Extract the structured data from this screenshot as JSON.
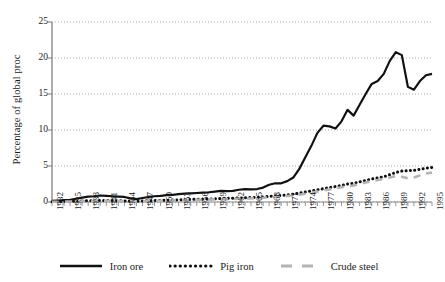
{
  "chart_data": {
    "type": "line",
    "title": "",
    "xlabel": "",
    "ylabel": "Percentage of global proc",
    "ylim": [
      0,
      25
    ],
    "yticks": [
      0,
      5,
      10,
      15,
      20,
      25
    ],
    "xlim": [
      1932,
      1995
    ],
    "xtick_step": 3,
    "grid": true,
    "grid_axis": "y",
    "grid_style": "dotted",
    "legend_position": "bottom-center",
    "x": [
      1932,
      1933,
      1934,
      1935,
      1936,
      1937,
      1938,
      1939,
      1940,
      1941,
      1942,
      1943,
      1944,
      1945,
      1946,
      1947,
      1948,
      1949,
      1950,
      1951,
      1952,
      1953,
      1954,
      1955,
      1956,
      1957,
      1958,
      1959,
      1960,
      1961,
      1962,
      1963,
      1964,
      1965,
      1966,
      1967,
      1968,
      1969,
      1970,
      1971,
      1972,
      1973,
      1974,
      1975,
      1976,
      1977,
      1978,
      1979,
      1980,
      1981,
      1982,
      1983,
      1984,
      1985,
      1986,
      1987,
      1988,
      1989,
      1990,
      1991,
      1992,
      1993,
      1994,
      1995
    ],
    "xticklabels": [
      "1932",
      "1935",
      "1938",
      "1941",
      "1944",
      "1947",
      "1950",
      "1953",
      "1956",
      "1959",
      "1962",
      "1965",
      "1968",
      "1971",
      "1974",
      "1977",
      "1980",
      "1983",
      "1986",
      "1989",
      "1992",
      "1995"
    ],
    "series": [
      {
        "name": "Iron ore",
        "color": "#111111",
        "style": "solid",
        "values": [
          0.15,
          0.2,
          0.25,
          0.3,
          0.45,
          0.6,
          0.75,
          0.8,
          0.9,
          0.85,
          0.8,
          0.75,
          0.7,
          0.5,
          0.4,
          0.55,
          0.7,
          0.8,
          0.85,
          0.95,
          1.0,
          1.1,
          1.15,
          1.2,
          1.25,
          1.3,
          1.35,
          1.45,
          1.55,
          1.5,
          1.55,
          1.7,
          1.8,
          1.75,
          1.8,
          2.0,
          2.4,
          2.6,
          2.6,
          2.9,
          3.4,
          4.6,
          6.2,
          7.8,
          9.6,
          10.6,
          10.5,
          10.2,
          11.2,
          12.8,
          12.0,
          13.5,
          15.0,
          16.4,
          16.8,
          17.8,
          19.6,
          20.8,
          20.4,
          16.0,
          15.6,
          16.8,
          17.6,
          17.8
        ]
      },
      {
        "name": "Pig iron",
        "color": "#111111",
        "style": "dotted",
        "values": [
          0.05,
          0.06,
          0.08,
          0.1,
          0.12,
          0.15,
          0.18,
          0.2,
          0.22,
          0.22,
          0.2,
          0.18,
          0.16,
          0.12,
          0.1,
          0.14,
          0.18,
          0.2,
          0.22,
          0.25,
          0.28,
          0.3,
          0.32,
          0.35,
          0.38,
          0.4,
          0.42,
          0.45,
          0.48,
          0.5,
          0.52,
          0.55,
          0.6,
          0.62,
          0.65,
          0.7,
          0.78,
          0.85,
          0.9,
          1.0,
          1.1,
          1.25,
          1.4,
          1.55,
          1.7,
          1.85,
          2.0,
          2.15,
          2.3,
          2.5,
          2.6,
          2.8,
          3.0,
          3.2,
          3.35,
          3.5,
          3.8,
          4.1,
          4.3,
          4.35,
          4.4,
          4.55,
          4.7,
          4.8
        ]
      },
      {
        "name": "Crude steel",
        "color": "#b3b3b3",
        "style": "dashed",
        "values": [
          0.03,
          0.04,
          0.05,
          0.07,
          0.09,
          0.12,
          0.14,
          0.16,
          0.18,
          0.18,
          0.16,
          0.14,
          0.12,
          0.09,
          0.07,
          0.1,
          0.13,
          0.15,
          0.17,
          0.2,
          0.22,
          0.24,
          0.26,
          0.28,
          0.3,
          0.32,
          0.34,
          0.36,
          0.38,
          0.4,
          0.42,
          0.45,
          0.48,
          0.5,
          0.54,
          0.58,
          0.64,
          0.7,
          0.76,
          0.84,
          0.92,
          1.02,
          1.15,
          1.3,
          1.45,
          1.6,
          1.75,
          1.9,
          2.05,
          2.2,
          2.3,
          2.5,
          2.7,
          2.9,
          3.05,
          3.2,
          3.4,
          3.6,
          3.5,
          3.3,
          3.4,
          3.7,
          3.95,
          4.1
        ]
      }
    ]
  },
  "legend": {
    "items": [
      {
        "label": "Iron ore",
        "style": "solid",
        "color": "#111111"
      },
      {
        "label": "Pig iron",
        "style": "dotted",
        "color": "#111111"
      },
      {
        "label": "Crude steel",
        "style": "dashed",
        "color": "#b3b3b3"
      }
    ]
  }
}
